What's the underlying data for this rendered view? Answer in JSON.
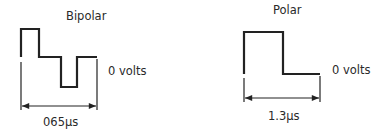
{
  "bipolar": {
    "title": "Bipolar",
    "zero_label": "0 volts",
    "duration_label": "065μs",
    "waveform": [
      [
        21,
        57
      ],
      [
        21,
        29
      ],
      [
        39,
        29
      ],
      [
        39,
        57
      ],
      [
        61,
        57
      ],
      [
        61,
        87
      ],
      [
        77,
        87
      ],
      [
        77,
        57
      ],
      [
        97,
        57
      ]
    ]
  },
  "polar": {
    "title": "Polar",
    "zero_label": "0 volts",
    "duration_label": "1.3μs",
    "waveform": [
      [
        244,
        74
      ],
      [
        244,
        32
      ],
      [
        283,
        32
      ],
      [
        283,
        74
      ],
      [
        320,
        74
      ]
    ]
  },
  "colors": {
    "line": "#222222",
    "text": "#2a2a2a",
    "background": "#ffffff"
  }
}
